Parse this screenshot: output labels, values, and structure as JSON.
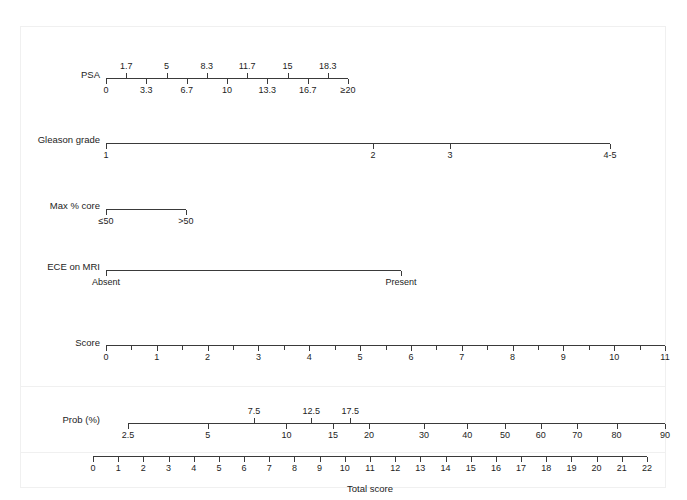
{
  "figure": {
    "type": "nomogram",
    "title": "",
    "bottom_axis_title": "Total score"
  },
  "chart_data": {
    "type": "nomogram",
    "title": "",
    "xlabel": "Total score",
    "ylabel": "",
    "rows": [
      {
        "name": "psa",
        "label": "PSA",
        "axis_start_px": 106,
        "axis_end_px": 348,
        "ticks_above": [
          {
            "label": "1.7",
            "pos": 0.0833
          },
          {
            "label": "5",
            "pos": 0.25
          },
          {
            "label": "8.3",
            "pos": 0.4167
          },
          {
            "label": "11.7",
            "pos": 0.5833
          },
          {
            "label": "15",
            "pos": 0.75
          },
          {
            "label": "18.3",
            "pos": 0.9167
          }
        ],
        "ticks_below": [
          {
            "label": "0",
            "pos": 0.0
          },
          {
            "label": "3.3",
            "pos": 0.1667
          },
          {
            "label": "6.7",
            "pos": 0.3333
          },
          {
            "label": "10",
            "pos": 0.5
          },
          {
            "label": "13.3",
            "pos": 0.6667
          },
          {
            "label": "16.7",
            "pos": 0.8333
          },
          {
            "label": "≥20",
            "pos": 1.0
          }
        ]
      },
      {
        "name": "gleason-grade",
        "label": "Gleason grade",
        "axis_start_px": 106,
        "axis_end_px": 610,
        "ticks_above": [],
        "ticks_below": [
          {
            "label": "1",
            "pos": 0.0
          },
          {
            "label": "2",
            "pos": 0.5298
          },
          {
            "label": "3",
            "pos": 0.6825
          },
          {
            "label": "4-5",
            "pos": 1.0
          }
        ]
      },
      {
        "name": "max-percent-core",
        "label": "Max % core",
        "axis_start_px": 106,
        "axis_end_px": 186,
        "ticks_above": [],
        "ticks_below": [
          {
            "label": "≤50",
            "pos": 0.0
          },
          {
            "label": ">50",
            "pos": 1.0
          }
        ]
      },
      {
        "name": "ece-on-mri",
        "label": "ECE on MRI",
        "axis_start_px": 106,
        "axis_end_px": 401,
        "ticks_above": [],
        "ticks_below": [
          {
            "label": "Absent",
            "pos": 0.0
          },
          {
            "label": "Present",
            "pos": 1.0
          }
        ]
      },
      {
        "name": "score",
        "label": "Score",
        "axis_start_px": 106,
        "axis_end_px": 665,
        "ticks_above": [],
        "ticks_below": [
          {
            "label": "0",
            "pos": 0.0
          },
          {
            "label": "1",
            "pos": 0.0909
          },
          {
            "label": "2",
            "pos": 0.1818
          },
          {
            "label": "3",
            "pos": 0.2727
          },
          {
            "label": "4",
            "pos": 0.3636
          },
          {
            "label": "5",
            "pos": 0.4545
          },
          {
            "label": "6",
            "pos": 0.5455
          },
          {
            "label": "7",
            "pos": 0.6364
          },
          {
            "label": "8",
            "pos": 0.7273
          },
          {
            "label": "9",
            "pos": 0.8182
          },
          {
            "label": "10",
            "pos": 0.9091
          },
          {
            "label": "11",
            "pos": 1.0
          }
        ],
        "minor_ticks": [
          0.0455,
          0.1364,
          0.2273,
          0.3182,
          0.4091,
          0.5,
          0.5909,
          0.6818,
          0.7727,
          0.8636,
          0.9545
        ]
      },
      {
        "name": "probability",
        "label": "Prob (%)",
        "axis_start_px": 128,
        "axis_end_px": 665,
        "ticks_above": [
          {
            "label": "7.5",
            "pos": 0.2742
          },
          {
            "label": "12.5",
            "pos": 0.3985
          },
          {
            "label": "17.5",
            "pos": 0.4836
          }
        ],
        "ticks_below": [
          {
            "label": "2.5",
            "pos": 0.0
          },
          {
            "label": "5",
            "pos": 0.1734
          },
          {
            "label": "10",
            "pos": 0.3447
          },
          {
            "label": "15",
            "pos": 0.4462
          },
          {
            "label": "20",
            "pos": 0.5243
          },
          {
            "label": "30",
            "pos": 0.6441
          },
          {
            "label": "40",
            "pos": 0.7383
          },
          {
            "label": "50",
            "pos": 0.8202
          },
          {
            "label": "60",
            "pos": 0.8981
          },
          {
            "label": "70",
            "pos": 0.9773
          },
          {
            "label": "80",
            "pos": 1.0629
          },
          {
            "label": "90",
            "pos": 1.1683
          }
        ]
      },
      {
        "name": "total-score",
        "label": "",
        "axis_start_px": 93,
        "axis_end_px": 647,
        "ticks_above": [],
        "ticks_below": [
          {
            "label": "0",
            "pos": 0.0
          },
          {
            "label": "1",
            "pos": 0.04545
          },
          {
            "label": "2",
            "pos": 0.09091
          },
          {
            "label": "3",
            "pos": 0.13636
          },
          {
            "label": "4",
            "pos": 0.18182
          },
          {
            "label": "5",
            "pos": 0.22727
          },
          {
            "label": "6",
            "pos": 0.27273
          },
          {
            "label": "7",
            "pos": 0.31818
          },
          {
            "label": "8",
            "pos": 0.36364
          },
          {
            "label": "9",
            "pos": 0.40909
          },
          {
            "label": "10",
            "pos": 0.45455
          },
          {
            "label": "11",
            "pos": 0.5
          },
          {
            "label": "12",
            "pos": 0.54545
          },
          {
            "label": "13",
            "pos": 0.59091
          },
          {
            "label": "14",
            "pos": 0.63636
          },
          {
            "label": "15",
            "pos": 0.68182
          },
          {
            "label": "16",
            "pos": 0.72727
          },
          {
            "label": "17",
            "pos": 0.77273
          },
          {
            "label": "18",
            "pos": 0.81818
          },
          {
            "label": "19",
            "pos": 0.86364
          },
          {
            "label": "20",
            "pos": 0.90909
          },
          {
            "label": "21",
            "pos": 0.95455
          },
          {
            "label": "22",
            "pos": 1.0
          }
        ]
      }
    ]
  },
  "labels": {
    "psa": "PSA",
    "gleason": "Gleason grade",
    "max_core": "Max % core",
    "ece": "ECE on MRI",
    "score": "Score",
    "prob": "Prob (%)",
    "total_score": "Total score"
  },
  "colors": {
    "axis": "#3a3a3a",
    "text": "#1d1d1d",
    "panel_border": "#f0f0f0",
    "background": "#ffffff"
  }
}
